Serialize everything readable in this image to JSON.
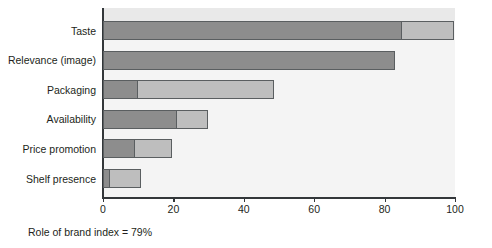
{
  "chart_data": {
    "type": "bar",
    "orientation": "horizontal",
    "stacked": true,
    "title": "",
    "subtitle": "",
    "xlabel": "",
    "ylabel": "",
    "xlim": [
      0,
      100
    ],
    "xticks": [
      0,
      20,
      40,
      60,
      80,
      100
    ],
    "xtick_labels": [
      "0",
      "20",
      "40",
      "60",
      "80",
      "100"
    ],
    "grid": false,
    "legend": null,
    "categories": [
      "Taste",
      "Relevance (image)",
      "Packaging",
      "Availability",
      "Price promotion",
      "Shelf presence"
    ],
    "series": [
      {
        "name": "primary",
        "color": "#8d8d8d",
        "values": [
          85,
          83,
          10,
          21,
          9,
          2
        ]
      },
      {
        "name": "secondary",
        "color": "#bebebe",
        "values": [
          15,
          0,
          39,
          9,
          11,
          9
        ]
      }
    ],
    "totals": [
      100,
      83,
      49,
      30,
      20,
      11
    ],
    "annotations": [
      {
        "name": "role-of-brand-index",
        "text": "Role of brand index = 79%"
      }
    ]
  },
  "caption": {
    "text": "Role of brand index = 79%"
  },
  "colors": {
    "primary_segment": "#8d8d8d",
    "secondary_segment": "#bebebe",
    "segment_border": "#5a5e60",
    "plot_background": "#f4f4f4",
    "plot_top_band": "#e9e9e9",
    "axis": "#33373a",
    "text": "#231f20"
  }
}
